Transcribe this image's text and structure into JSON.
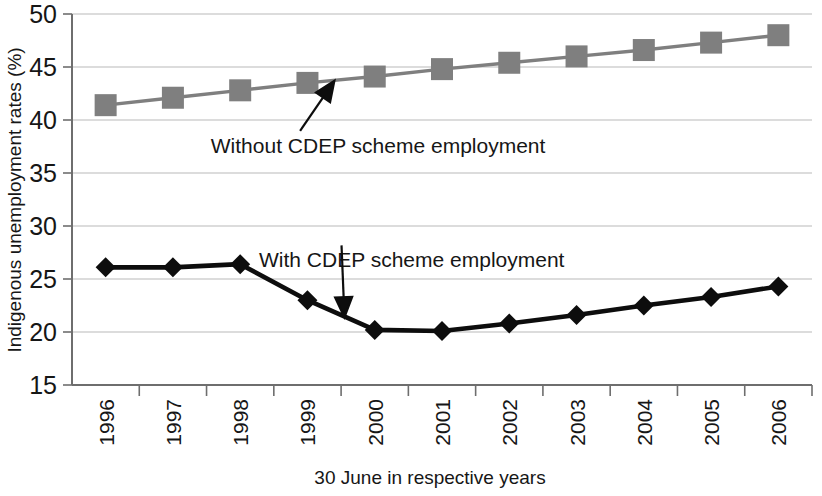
{
  "chart_data": {
    "type": "line",
    "title": "",
    "xlabel": "30 June in respective years",
    "ylabel": "Indigenous unemployment rates (%)",
    "categories": [
      "1996",
      "1997",
      "1998",
      "1999",
      "2000",
      "2001",
      "2002",
      "2003",
      "2004",
      "2005",
      "2006"
    ],
    "x": [
      1996,
      1997,
      1998,
      1999,
      2000,
      2001,
      2002,
      2003,
      2004,
      2005,
      2006
    ],
    "ylim": [
      15,
      50
    ],
    "yticks": [
      15,
      20,
      25,
      30,
      35,
      40,
      45,
      50
    ],
    "ytick_labels": [
      "15",
      "20",
      "25",
      "30",
      "35",
      "40",
      "45",
      "50"
    ],
    "grid": "horizontal",
    "legend_position": "inline-annotations",
    "series": [
      {
        "name": "Without CDEP scheme employment",
        "marker": "square",
        "color": "#7f7f7f",
        "values": [
          41.4,
          42.1,
          42.8,
          43.5,
          44.1,
          44.8,
          45.4,
          46.0,
          46.6,
          47.3,
          48.0
        ]
      },
      {
        "name": "With CDEP scheme employment",
        "marker": "diamond",
        "color": "#0d0d0d",
        "values": [
          26.1,
          26.1,
          26.4,
          23.0,
          20.2,
          20.1,
          20.8,
          21.6,
          22.5,
          23.3,
          24.3
        ]
      }
    ],
    "annotations": [
      {
        "text": "Without CDEP scheme employment",
        "target_x": 1999.4,
        "target_y": 43.7,
        "text_x": 2000.05,
        "text_y": 36.9,
        "anchor": "middle"
      },
      {
        "text": "With CDEP scheme employment",
        "target_x": 1999.55,
        "target_y": 21.4,
        "text_x": 2000.55,
        "text_y": 26.1,
        "anchor": "middle"
      }
    ]
  },
  "axes": {
    "y_title": "Indigenous unemployment rates (%)",
    "x_title": "30 June in respective years"
  }
}
